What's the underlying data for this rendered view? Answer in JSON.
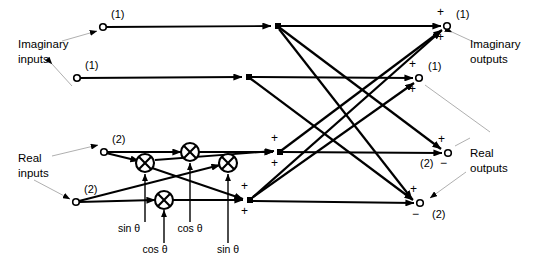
{
  "figure": {
    "type": "signal-flow-diagram",
    "ink_color": "#000000",
    "background_color": "#ffffff",
    "leader_color": "#8a8a8a"
  },
  "labels": {
    "imaginary_inputs": "Imaginary\ninputs",
    "imaginary_inputs_line1": "Imaginary",
    "imaginary_inputs_line2": "inputs",
    "real_inputs_line1": "Real",
    "real_inputs_line2": "inputs",
    "imaginary_outputs_line1": "Imaginary",
    "imaginary_outputs_line2": "outputs",
    "real_outputs_line1": "Real",
    "real_outputs_line2": "outputs"
  },
  "input_nodes": [
    {
      "name": "imaginary-input-1",
      "label": "(1)",
      "x": 103,
      "y": 27,
      "label_x": 111,
      "label_y": 18
    },
    {
      "name": "imaginary-input-2",
      "label": "(1)",
      "x": 77,
      "y": 78,
      "label_x": 85,
      "label_y": 69
    },
    {
      "name": "real-input-1",
      "label": "(2)",
      "x": 104,
      "y": 152,
      "label_x": 112,
      "label_y": 143
    },
    {
      "name": "real-input-2",
      "label": "(2)",
      "x": 76,
      "y": 202,
      "label_x": 84,
      "label_y": 193
    }
  ],
  "output_nodes": [
    {
      "name": "imaginary-output-1",
      "label": "(1)",
      "x": 447,
      "y": 26,
      "label_x": 456,
      "label_y": 18,
      "signs": [
        "+",
        "+"
      ]
    },
    {
      "name": "imaginary-output-2",
      "label": "(1)",
      "x": 419,
      "y": 78,
      "label_x": 428,
      "label_y": 70,
      "signs": [
        "+",
        "+"
      ]
    },
    {
      "name": "real-output-1",
      "label": "(2)",
      "x": 448,
      "y": 153,
      "label_x": 424,
      "label_y": 167,
      "signs": [
        "+",
        "−"
      ]
    },
    {
      "name": "real-output-2",
      "label": "(2)",
      "x": 420,
      "y": 203,
      "label_x": 432,
      "label_y": 218,
      "signs": [
        "+",
        "−"
      ]
    }
  ],
  "multipliers": [
    {
      "name": "multiplier-sin-theta-upper",
      "x": 145,
      "y": 163,
      "r": 9,
      "coefficient": "sin θ",
      "coef_x": 129,
      "coef_y": 232
    },
    {
      "name": "multiplier-cos-theta-upper",
      "x": 190,
      "y": 152,
      "r": 9,
      "coefficient": "cos θ",
      "coef_x": 190,
      "coef_y": 232
    },
    {
      "name": "multiplier-sin-theta-right",
      "x": 228,
      "y": 163,
      "r": 9,
      "coefficient": "sin θ",
      "coef_x": 228,
      "coef_y": 253
    },
    {
      "name": "multiplier-cos-theta-lower",
      "x": 164,
      "y": 199,
      "r": 9,
      "coefficient": "cos θ",
      "coef_x": 155,
      "coef_y": 253
    }
  ],
  "coefficient_labels": [
    {
      "name": "coef-sin-theta-1",
      "text": "sin θ",
      "x": 129,
      "y": 232
    },
    {
      "name": "coef-cos-theta-1",
      "text": "cos θ",
      "x": 190,
      "y": 232
    },
    {
      "name": "coef-cos-theta-2",
      "text": "cos θ",
      "x": 155,
      "y": 253
    },
    {
      "name": "coef-sin-theta-2",
      "text": "sin θ",
      "x": 228,
      "y": 253
    }
  ],
  "branch_nodes": [
    {
      "name": "branch-node-imag-1",
      "x": 278,
      "y": 26
    },
    {
      "name": "branch-node-imag-2",
      "x": 249,
      "y": 77
    }
  ],
  "sum_nodes": [
    {
      "name": "sum-node-real-upper",
      "x": 280,
      "y": 152,
      "signs": [
        "+",
        "+"
      ]
    },
    {
      "name": "sum-node-real-lower",
      "x": 250,
      "y": 200,
      "signs": [
        "+",
        "+"
      ]
    }
  ],
  "sign_marks": [
    {
      "name": "plus-imag-out-1-top",
      "text": "+",
      "x": 437,
      "y": 16
    },
    {
      "name": "plus-imag-out-1-bottom",
      "text": "+",
      "x": 437,
      "y": 41
    },
    {
      "name": "plus-imag-out-2-top",
      "text": "+",
      "x": 409,
      "y": 68
    },
    {
      "name": "plus-imag-out-2-bottom",
      "text": "+",
      "x": 409,
      "y": 93
    },
    {
      "name": "plus-sum-upper-top",
      "text": "+",
      "x": 271,
      "y": 142
    },
    {
      "name": "plus-sum-upper-bottom",
      "text": "+",
      "x": 271,
      "y": 167
    },
    {
      "name": "plus-sum-lower-top",
      "text": "+",
      "x": 241,
      "y": 190
    },
    {
      "name": "plus-sum-lower-bottom",
      "text": "+",
      "x": 241,
      "y": 215
    },
    {
      "name": "plus-real-out-1",
      "text": "+",
      "x": 438,
      "y": 143
    },
    {
      "name": "minus-real-out-1",
      "text": "−",
      "x": 440,
      "y": 167
    },
    {
      "name": "plus-real-out-2",
      "text": "+",
      "x": 410,
      "y": 193
    },
    {
      "name": "minus-real-out-2",
      "text": "−",
      "x": 412,
      "y": 218
    }
  ],
  "text_callouts": [
    {
      "name": "imaginary-inputs-label",
      "line1": "Imaginary",
      "line2": "inputs",
      "x": 18,
      "y": 52
    },
    {
      "name": "real-inputs-label",
      "line1": "Real",
      "line2": "inputs",
      "x": 18,
      "y": 168
    },
    {
      "name": "imaginary-outputs-label",
      "line1": "Imaginary",
      "line2": "outputs",
      "x": 470,
      "y": 50
    },
    {
      "name": "real-outputs-label",
      "line1": "Real",
      "line2": "outputs",
      "x": 470,
      "y": 163
    }
  ]
}
